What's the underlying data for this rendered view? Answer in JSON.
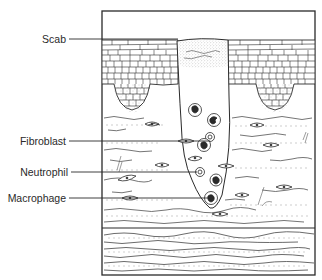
{
  "figure": {
    "type": "histology-diagram",
    "labels": [
      {
        "id": "scab",
        "text": "Scab",
        "y": 39,
        "line_end_x": 178
      },
      {
        "id": "fibroblast",
        "text": "Fibroblast",
        "y": 141,
        "line_end_x": 210
      },
      {
        "id": "neutrophil",
        "text": "Neutrophil",
        "y": 172,
        "line_end_x": 197
      },
      {
        "id": "macrophage",
        "text": "Macrophage",
        "y": 198,
        "line_end_x": 208
      }
    ],
    "colors": {
      "ink": "#2a2a2a",
      "background": "#ffffff",
      "cell_fill": "#3a3a3a",
      "stipple": "#9a9a9a"
    }
  }
}
